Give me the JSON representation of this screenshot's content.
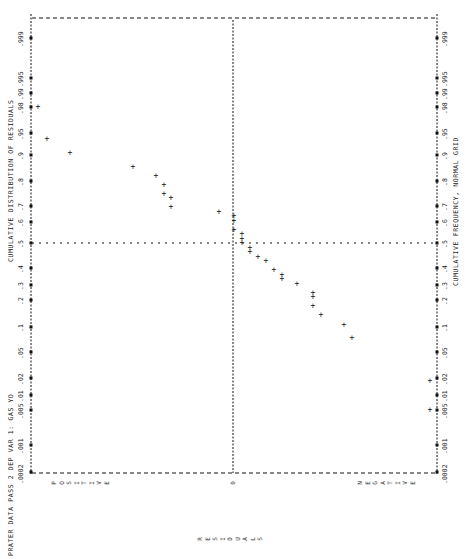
{
  "chart_data": {
    "type": "scatter",
    "orientation": "rotated-90-ccw",
    "title": "PRATER DATA PASS 2  DEP VAR 1: GAS YD",
    "ylabel_left": "CUMULATIVE DISTRIBUTION OF RESIDUALS",
    "ylabel_right": "CUMULATIVE FREQUENCY, NORMAL GRID",
    "xlabel": "RESIDUALS",
    "x_regions": {
      "left": "POSITIVE",
      "center": "0",
      "right": "NEGATIVE"
    },
    "probability_ticks": [
      ".0002",
      ".001",
      ".005",
      ".01",
      ".02",
      ".05",
      ".1",
      ".2",
      ".3",
      ".4",
      ".5",
      ".6",
      ".7",
      ".8",
      ".9",
      ".95",
      ".98",
      ".99",
      ".995",
      ".999"
    ],
    "grid": {
      "reference_lines": [
        "residual = 0",
        "probability = .5"
      ]
    },
    "points_px": [
      {
        "x": 38,
        "y": 107
      },
      {
        "x": 47,
        "y": 139
      },
      {
        "x": 70,
        "y": 153
      },
      {
        "x": 133,
        "y": 167
      },
      {
        "x": 156,
        "y": 176
      },
      {
        "x": 164,
        "y": 185
      },
      {
        "x": 164,
        "y": 194
      },
      {
        "x": 171,
        "y": 198
      },
      {
        "x": 171,
        "y": 207
      },
      {
        "x": 219,
        "y": 212
      },
      {
        "x": 234,
        "y": 216
      },
      {
        "x": 234,
        "y": 221
      },
      {
        "x": 234,
        "y": 230
      },
      {
        "x": 242,
        "y": 234
      },
      {
        "x": 242,
        "y": 239
      },
      {
        "x": 242,
        "y": 243
      },
      {
        "x": 250,
        "y": 248
      },
      {
        "x": 250,
        "y": 252
      },
      {
        "x": 258,
        "y": 257
      },
      {
        "x": 266,
        "y": 261
      },
      {
        "x": 274,
        "y": 270
      },
      {
        "x": 282,
        "y": 275
      },
      {
        "x": 282,
        "y": 279
      },
      {
        "x": 297,
        "y": 284
      },
      {
        "x": 313,
        "y": 293
      },
      {
        "x": 313,
        "y": 297
      },
      {
        "x": 313,
        "y": 306
      },
      {
        "x": 321,
        "y": 315
      },
      {
        "x": 344,
        "y": 325
      },
      {
        "x": 352,
        "y": 338
      },
      {
        "x": 430,
        "y": 381
      },
      {
        "x": 430,
        "y": 410
      }
    ]
  },
  "labels": {
    "title": "PRATER DATA PASS 2  DEP VAR 1: GAS YD",
    "left_axis_title": "CUMULATIVE DISTRIBUTION OF RESIDUALS",
    "right_axis_title": "CUMULATIVE FREQUENCY, NORMAL GRID",
    "x_axis_title": "RESIDUALS",
    "positive": "POSITIVE",
    "zero": "0",
    "negative": "NEGATIVE"
  },
  "ticks": [
    {
      "label": ".0002",
      "y": 472
    },
    {
      "label": ".001",
      "y": 445
    },
    {
      "label": ".005",
      "y": 410
    },
    {
      "label": ".01",
      "y": 395
    },
    {
      "label": ".02",
      "y": 378
    },
    {
      "label": ".05",
      "y": 352
    },
    {
      "label": ".1",
      "y": 327
    },
    {
      "label": ".2",
      "y": 300
    },
    {
      "label": ".3",
      "y": 285
    },
    {
      "label": ".4",
      "y": 268
    },
    {
      "label": ".5",
      "y": 243
    },
    {
      "label": ".6",
      "y": 222
    },
    {
      "label": ".7",
      "y": 206
    },
    {
      "label": ".8",
      "y": 181
    },
    {
      "label": ".9",
      "y": 155
    },
    {
      "label": ".95",
      "y": 133
    },
    {
      "label": ".98",
      "y": 107
    },
    {
      "label": ".99",
      "y": 93
    },
    {
      "label": ".995",
      "y": 78
    },
    {
      "label": ".999",
      "y": 38
    }
  ]
}
